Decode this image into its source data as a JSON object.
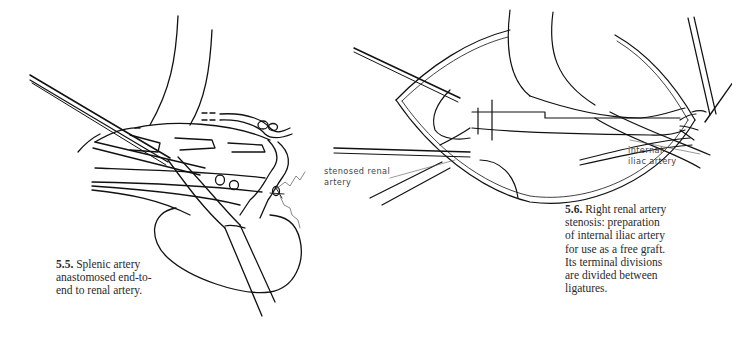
{
  "figures": [
    {
      "id": "5.5",
      "caption": {
        "number": "5.5.",
        "lines": [
          "Splenic artery",
          "anastomosed end-to-",
          "end to renal artery."
        ]
      },
      "labels": []
    },
    {
      "id": "5.6",
      "caption": {
        "number": "5.6.",
        "lines": [
          "Right renal artery",
          "stenosis: preparation",
          "of internal iliac artery",
          "for use as a free graft.",
          "Its terminal divisions",
          "are divided between",
          "ligatures."
        ]
      },
      "labels": [
        {
          "name": "stenosed-renal-artery-label",
          "lines": [
            "stenosed renal",
            "artery"
          ]
        },
        {
          "name": "internal-iliac-artery-label",
          "lines": [
            "internal",
            "iliac artery"
          ]
        }
      ]
    }
  ],
  "colors": {
    "ink": "#111111",
    "text": "#2a2a2a",
    "label": "#444444",
    "background": "#ffffff"
  }
}
